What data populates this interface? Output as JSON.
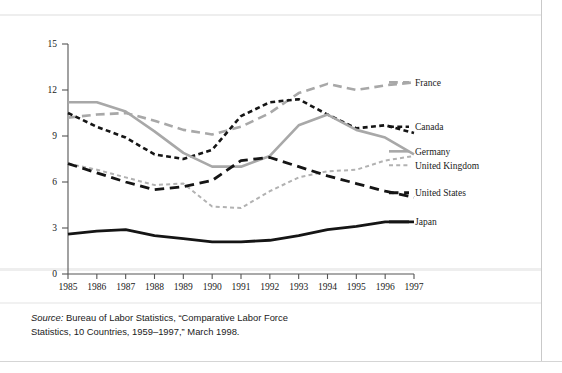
{
  "figure": {
    "source_note_lead": "Source:",
    "source_note_body": " Bureau of Labor Statistics, “Comparative Labor Force Statistics, 10 Countries, 1959–1997,” March 1998."
  },
  "chart_data": {
    "type": "line",
    "title": "",
    "xlabel": "",
    "ylabel": "",
    "grid": false,
    "legend_position": "right",
    "xlim": [
      1985,
      1997
    ],
    "ylim": [
      0,
      15
    ],
    "x": [
      1985,
      1986,
      1987,
      1988,
      1989,
      1990,
      1991,
      1992,
      1993,
      1994,
      1995,
      1996,
      1997
    ],
    "xticklabels": [
      "1985",
      "1986",
      "1987",
      "1988",
      "1989",
      "1990",
      "1991",
      "1992",
      "1993",
      "1994",
      "1995",
      "1996",
      "1997"
    ],
    "yticks": [
      0,
      3,
      6,
      9,
      12,
      15
    ],
    "yticklabels": [
      "0",
      "3",
      "6",
      "9",
      "12",
      "15"
    ],
    "series": [
      {
        "name": "France",
        "color": "#a8a8a8",
        "style": "long-dash",
        "width": 2.6,
        "label_x": 1997,
        "label_y": 12.5,
        "values": [
          10.2,
          10.4,
          10.5,
          10.0,
          9.4,
          9.1,
          9.6,
          10.5,
          11.8,
          12.4,
          12.0,
          12.3,
          12.5
        ]
      },
      {
        "name": "Canada",
        "color": "#151515",
        "style": "dot-dash",
        "width": 2.6,
        "label_x": 1997,
        "label_y": 9.6,
        "values": [
          10.5,
          9.6,
          8.9,
          7.8,
          7.5,
          8.1,
          10.3,
          11.2,
          11.4,
          10.4,
          9.5,
          9.7,
          9.2
        ]
      },
      {
        "name": "Germany",
        "color": "#a8a8a8",
        "style": "solid",
        "width": 2.6,
        "label_x": 1997,
        "label_y": 8.0,
        "values": [
          11.2,
          11.2,
          10.6,
          9.3,
          7.9,
          7.0,
          7.0,
          7.7,
          9.7,
          10.4,
          9.4,
          8.9,
          7.8
        ]
      },
      {
        "name": "United Kingdom",
        "color": "#b2b2b2",
        "style": "short-dash",
        "width": 2.0,
        "label_x": 1997,
        "label_y": 7.1,
        "values": [
          7.2,
          6.8,
          6.3,
          5.8,
          5.9,
          4.4,
          4.3,
          5.4,
          6.3,
          6.7,
          6.8,
          7.4,
          7.7
        ]
      },
      {
        "name": "United States",
        "color": "#151515",
        "style": "long-dash",
        "width": 2.8,
        "label_x": 1997,
        "label_y": 5.3,
        "values": [
          7.2,
          6.6,
          6.0,
          5.5,
          5.7,
          6.1,
          7.4,
          7.6,
          7.0,
          6.4,
          5.9,
          5.4,
          5.0
        ]
      },
      {
        "name": "Japan",
        "color": "#151515",
        "style": "solid",
        "width": 2.8,
        "label_x": 1997,
        "label_y": 3.4,
        "values": [
          2.6,
          2.8,
          2.9,
          2.5,
          2.3,
          2.1,
          2.1,
          2.2,
          2.5,
          2.9,
          3.1,
          3.4,
          3.4
        ]
      }
    ]
  }
}
